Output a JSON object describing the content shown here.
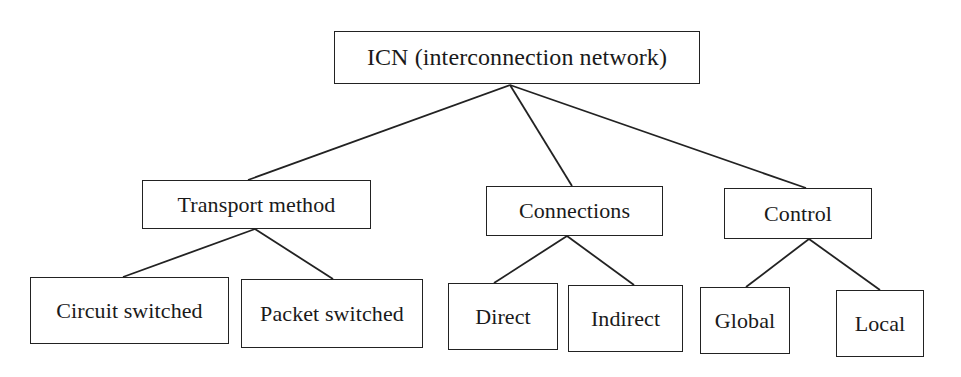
{
  "diagram": {
    "type": "tree",
    "root": {
      "id": "icn",
      "label": "ICN (interconnection network)",
      "children": [
        {
          "id": "transport",
          "label": "Transport method",
          "children": [
            {
              "id": "circuit",
              "label": "Circuit switched"
            },
            {
              "id": "packet",
              "label": "Packet switched"
            }
          ]
        },
        {
          "id": "connections",
          "label": "Connections",
          "children": [
            {
              "id": "direct",
              "label": "Direct"
            },
            {
              "id": "indirect",
              "label": "Indirect"
            }
          ]
        },
        {
          "id": "control",
          "label": "Control",
          "children": [
            {
              "id": "global",
              "label": "Global"
            },
            {
              "id": "local",
              "label": "Local"
            }
          ]
        }
      ]
    }
  },
  "nodes": {
    "icn": "ICN (interconnection network)",
    "transport": "Transport method",
    "connections": "Connections",
    "control": "Control",
    "circuit": "Circuit switched",
    "packet": "Packet switched",
    "direct": "Direct",
    "indirect": "Indirect",
    "global": "Global",
    "local": "Local"
  },
  "colors": {
    "line": "#222222",
    "text": "#1a1a1a",
    "background": "#ffffff"
  }
}
